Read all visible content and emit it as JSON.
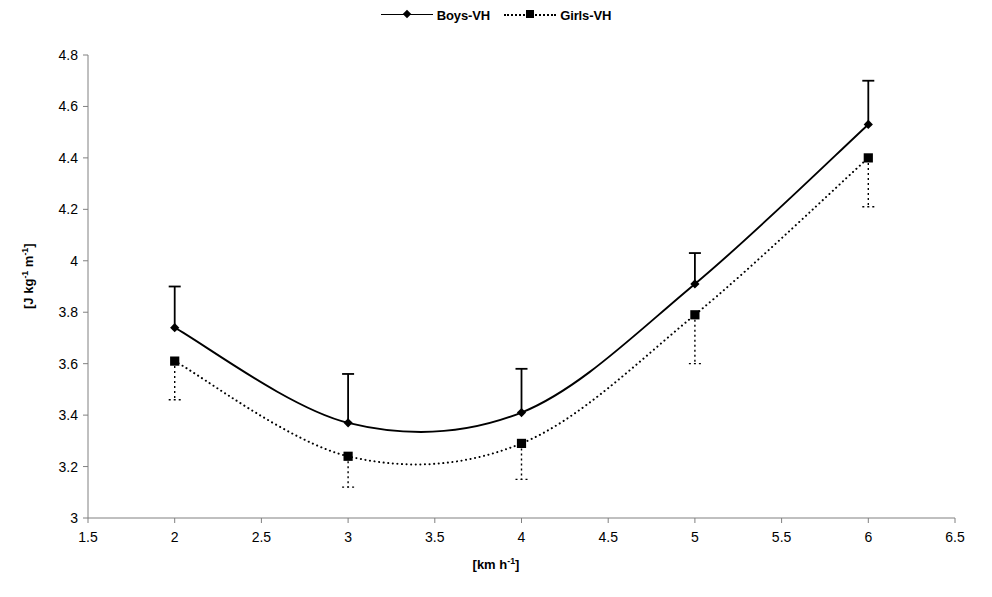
{
  "chart_data": {
    "type": "line",
    "title": "",
    "subtitle": "",
    "xlabel": "[km h-1]",
    "ylabel": "[J kg-1 m-1]",
    "xlim": [
      1.5,
      6.5
    ],
    "ylim": [
      3.0,
      4.8
    ],
    "xticks": [
      "1.5",
      "2",
      "2.5",
      "3",
      "3.5",
      "4",
      "4.5",
      "5",
      "5.5",
      "6",
      "6.5"
    ],
    "xtick_values": [
      1.5,
      2,
      2.5,
      3,
      3.5,
      4,
      4.5,
      5,
      5.5,
      6,
      6.5
    ],
    "yticks": [
      "3",
      "3.2",
      "3.4",
      "3.6",
      "3.8",
      "4",
      "4.2",
      "4.4",
      "4.6",
      "4.8"
    ],
    "ytick_values": [
      3,
      3.2,
      3.4,
      3.6,
      3.8,
      4,
      4.2,
      4.4,
      4.6,
      4.8
    ],
    "grid": false,
    "legend_position": "top-center",
    "x": [
      2,
      3,
      4,
      5,
      6
    ],
    "series": [
      {
        "name": "Boys-VH",
        "marker": "diamond",
        "linestyle": "solid",
        "color": "#000000",
        "values": [
          3.74,
          3.37,
          3.41,
          3.91,
          4.53
        ],
        "error_upper": [
          3.9,
          3.56,
          3.58,
          4.03,
          4.7
        ],
        "error_lower": [
          3.74,
          3.37,
          3.41,
          3.91,
          4.53
        ],
        "smooth": true
      },
      {
        "name": "Girls-VH",
        "marker": "square",
        "linestyle": "dotted",
        "color": "#000000",
        "values": [
          3.61,
          3.24,
          3.29,
          3.79,
          4.4
        ],
        "error_upper": [
          3.61,
          3.24,
          3.29,
          3.79,
          4.4
        ],
        "error_lower": [
          3.46,
          3.12,
          3.15,
          3.6,
          4.21
        ],
        "smooth": true
      }
    ]
  },
  "legend": {
    "entries": [
      {
        "label": "Boys-VH",
        "marker": "diamond-marker",
        "line": "solid-line"
      },
      {
        "label": "Girls-VH",
        "marker": "square-marker",
        "line": "dotted-line"
      }
    ]
  },
  "axes": {
    "x_title_main": "[km h",
    "x_title_sup": "-1",
    "x_title_tail": "]",
    "y_title_part1": "[J kg",
    "y_title_sup1": "-1",
    "y_title_part2": " m",
    "y_title_sup2": "-1",
    "y_title_tail": "]"
  },
  "colors": {
    "axis": "#808080",
    "data": "#000000",
    "background": "#ffffff"
  }
}
